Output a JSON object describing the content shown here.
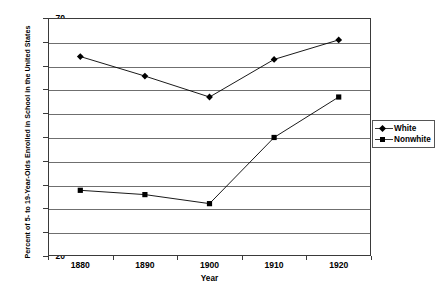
{
  "chart_data": {
    "type": "line",
    "title": "",
    "xlabel": "Year",
    "ylabel": "Percent of 5- to 19-Year-Olds Enrolled in School in the United States",
    "categories": [
      "1880",
      "1890",
      "1900",
      "1910",
      "1920"
    ],
    "x": [
      1880,
      1890,
      1900,
      1910,
      1920
    ],
    "ylim": [
      20,
      70
    ],
    "ytick_step": 5,
    "yticks": [
      70,
      65,
      60,
      55,
      50,
      45,
      40,
      35,
      30,
      25,
      20
    ],
    "grid": "horizontal",
    "legend_position": "right",
    "series": [
      {
        "name": "White",
        "marker": "diamond",
        "color": "#000000",
        "values": [
          61.9,
          57.8,
          53.4,
          61.3,
          65.4
        ]
      },
      {
        "name": "Nonwhite",
        "marker": "square",
        "color": "#000000",
        "values": [
          33.8,
          32.9,
          31.0,
          44.9,
          53.4
        ]
      }
    ]
  },
  "legend": {
    "items": [
      {
        "label": "White",
        "marker": "diamond-marker-icon"
      },
      {
        "label": "Nonwhite",
        "marker": "square-marker-icon"
      }
    ]
  },
  "colors": {
    "background": "#ffffff",
    "frame": "#3a3a3a",
    "gridline": "#6f6f6f",
    "series": "#000000",
    "text": "#000000"
  }
}
